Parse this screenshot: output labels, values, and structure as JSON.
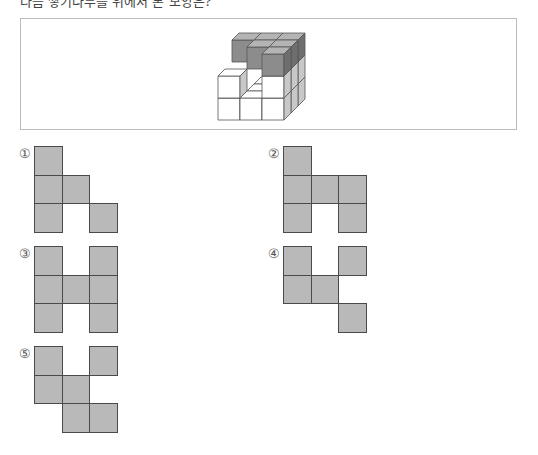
{
  "question": {
    "text": "다음 쌓기나무를 위에서 본 모양은?"
  },
  "figure": {
    "colors": {
      "dark_front": "#8c8c8c",
      "dark_top": "#b4b4b4",
      "dark_side": "#6e6e6e",
      "light_front": "#ffffff",
      "light_top": "#ffffff",
      "light_side": "#c8c8c8",
      "stroke": "#555555"
    }
  },
  "options": [
    {
      "label": "①",
      "cells": [
        [
          0,
          0
        ],
        [
          0,
          1
        ],
        [
          1,
          1
        ],
        [
          0,
          2
        ],
        [
          2,
          2
        ]
      ]
    },
    {
      "label": "②",
      "cells": [
        [
          0,
          0
        ],
        [
          0,
          1
        ],
        [
          1,
          1
        ],
        [
          2,
          1
        ],
        [
          0,
          2
        ],
        [
          2,
          2
        ]
      ]
    },
    {
      "label": "③",
      "cells": [
        [
          0,
          0
        ],
        [
          2,
          0
        ],
        [
          0,
          1
        ],
        [
          1,
          1
        ],
        [
          2,
          1
        ],
        [
          0,
          2
        ],
        [
          2,
          2
        ]
      ]
    },
    {
      "label": "④",
      "cells": [
        [
          0,
          0
        ],
        [
          2,
          0
        ],
        [
          0,
          1
        ],
        [
          1,
          1
        ],
        [
          2,
          2
        ]
      ]
    },
    {
      "label": "⑤",
      "cells": [
        [
          0,
          0
        ],
        [
          2,
          0
        ],
        [
          0,
          1
        ],
        [
          1,
          1
        ],
        [
          1,
          2
        ],
        [
          2,
          2
        ]
      ]
    }
  ],
  "style": {
    "cell_fill": "#b9b9b9",
    "cell_stroke": "#4a4a4a"
  }
}
